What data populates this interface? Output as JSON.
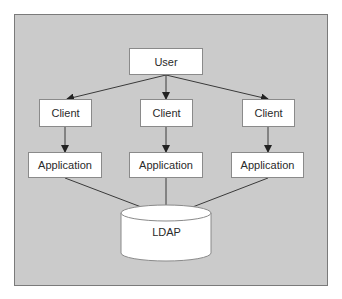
{
  "diagram": {
    "nodes": {
      "user": {
        "label": "User"
      },
      "client_left": {
        "label": "Client"
      },
      "client_middle": {
        "label": "Client"
      },
      "client_right": {
        "label": "Client"
      },
      "app_left": {
        "label": "Application"
      },
      "app_middle": {
        "label": "Application"
      },
      "app_right": {
        "label": "Application"
      },
      "ldap": {
        "label": "LDAP",
        "shape": "cylinder"
      }
    },
    "edges": [
      {
        "from": "User",
        "to": "Client (left)"
      },
      {
        "from": "User",
        "to": "Client (middle)"
      },
      {
        "from": "User",
        "to": "Client (right)"
      },
      {
        "from": "Client (left)",
        "to": "Application (left)"
      },
      {
        "from": "Client (middle)",
        "to": "Application (middle)"
      },
      {
        "from": "Client (right)",
        "to": "Application (right)"
      },
      {
        "from": "Application (left)",
        "to": "LDAP"
      },
      {
        "from": "Application (middle)",
        "to": "LDAP"
      },
      {
        "from": "Application (right)",
        "to": "LDAP"
      }
    ],
    "colors": {
      "panel_background": "#cbcbcb",
      "panel_border": "#7a7a7a",
      "node_fill": "#ffffff",
      "line": "#3a3a3a"
    }
  }
}
